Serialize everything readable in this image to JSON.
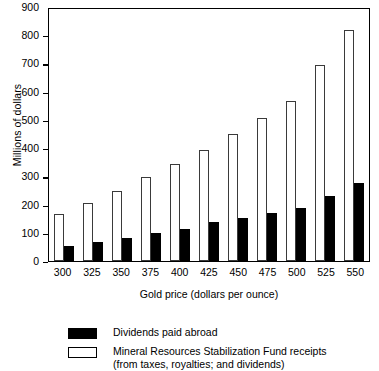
{
  "chart_data": {
    "type": "bar",
    "title": "",
    "xlabel": "Gold price (dollars per ounce)",
    "ylabel": "Millions of dollars",
    "categories": [
      "300",
      "325",
      "350",
      "375",
      "400",
      "425",
      "450",
      "475",
      "500",
      "525",
      "550"
    ],
    "ylim": [
      0,
      900
    ],
    "yticks": [
      0,
      100,
      200,
      300,
      400,
      500,
      600,
      700,
      800,
      900
    ],
    "grid": false,
    "legend_position": "below",
    "series": [
      {
        "name": "Mineral Resources Stabilization Fund receipts",
        "values": [
          168,
          205,
          247,
          296,
          345,
          394,
          450,
          508,
          567,
          693,
          820
        ]
      },
      {
        "name": "Dividends paid abroad",
        "values": [
          52,
          67,
          82,
          100,
          115,
          137,
          152,
          170,
          189,
          231,
          277
        ]
      }
    ]
  },
  "axis": {
    "y_title": "Millions of dollars",
    "x_title": "Gold price (dollars per ounce)",
    "y_tick_labels": [
      "900",
      "800",
      "700",
      "600",
      "500",
      "400",
      "300",
      "200",
      "100",
      "0"
    ],
    "x_tick_labels": [
      "300",
      "325",
      "350",
      "375",
      "400",
      "425",
      "450",
      "475",
      "500",
      "525",
      "550"
    ]
  },
  "legend": {
    "items": [
      {
        "swatch": "black",
        "label": "Dividends paid abroad",
        "sublabel": ""
      },
      {
        "swatch": "white",
        "label": "Mineral Resources Stabilization Fund receipts",
        "sublabel": "(from taxes, royalties; and dividends)"
      }
    ]
  },
  "colors": {
    "series_black": "#000000",
    "series_white": "#ffffff",
    "axis": "#000000",
    "background": "#ffffff"
  }
}
